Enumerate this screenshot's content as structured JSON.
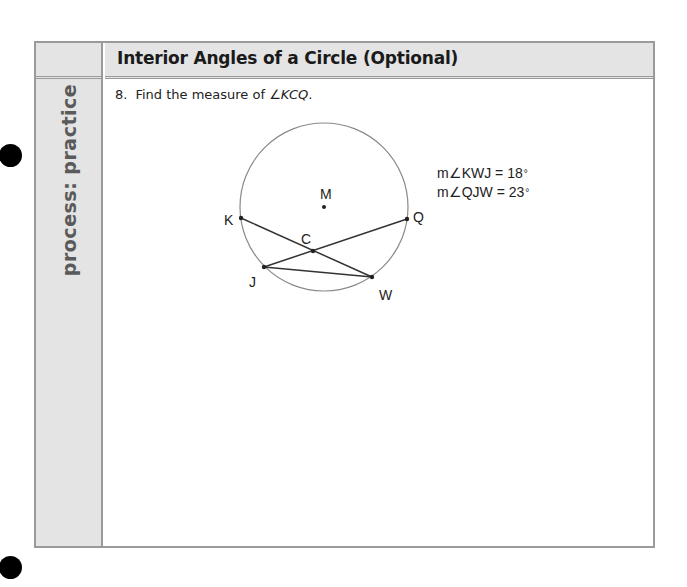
{
  "page": {
    "section_label": "process: practice",
    "header_title": "Interior Angles of a Circle (Optional)"
  },
  "question": {
    "number": "8.",
    "prompt": "Find the measure of ",
    "angle_symbol": "∠",
    "angle_name": "KCQ",
    "terminal": "."
  },
  "diagram": {
    "circle": {
      "center": [
        324,
        207
      ],
      "radius": 84,
      "center_label": "M"
    },
    "points": {
      "M": {
        "label": "M",
        "x": 324,
        "y": 207
      },
      "K": {
        "label": "K",
        "x": 241,
        "y": 218
      },
      "Q": {
        "label": "Q",
        "x": 407,
        "y": 219
      },
      "C": {
        "label": "C",
        "x": 313,
        "y": 251
      },
      "J": {
        "label": "J",
        "x": 264,
        "y": 267
      },
      "W": {
        "label": "W",
        "x": 372,
        "y": 277
      }
    },
    "segments": [
      [
        "K",
        "W"
      ],
      [
        "Q",
        "J"
      ],
      [
        "J",
        "W"
      ]
    ]
  },
  "givens": [
    {
      "prefix": "m∠",
      "angle": "KWJ",
      "equals": " = ",
      "value": "18",
      "unit": "°"
    },
    {
      "prefix": "m∠",
      "angle": "QJW",
      "equals": " = ",
      "value": "23",
      "unit": "°"
    }
  ]
}
